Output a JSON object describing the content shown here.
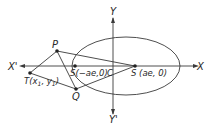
{
  "diagram": {
    "type": "ellipse-tangents",
    "colors": {
      "stroke": "#3a3a3a",
      "background": "#ffffff"
    },
    "axes": {
      "x_pos_label": "X",
      "x_neg_label": "X'",
      "y_pos_label": "Y",
      "y_neg_label": "Y'"
    },
    "points": {
      "P": "P",
      "Q": "Q",
      "T": "T(x",
      "T_sub1": "1",
      "T_mid": ", y",
      "T_sub2": "1",
      "T_end": ")",
      "C": "C",
      "S1": "S(−ae,0)",
      "S2": "S (ae, 0)"
    }
  }
}
